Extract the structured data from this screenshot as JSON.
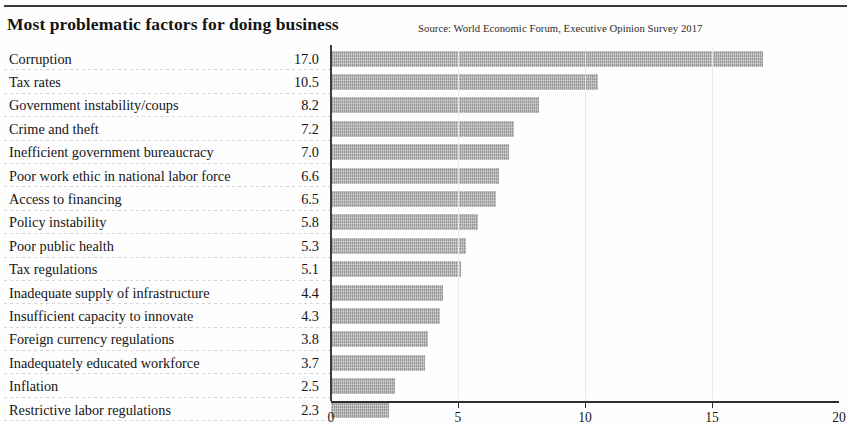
{
  "header": {
    "title": "Most problematic factors for doing business",
    "source": "Source: World Economic Forum, Executive Opinion Survey 2017"
  },
  "axis": {
    "ticks": [
      "0",
      "5",
      "10",
      "15",
      "20"
    ]
  },
  "colors": {
    "bar": "#aaaaaa",
    "axis": "#2f2f2f",
    "text": "#151515",
    "gridline": "#e9e9e9",
    "separator": "#cfcfcf"
  },
  "chart_data": {
    "type": "bar",
    "orientation": "horizontal",
    "title": "Most problematic factors for doing business",
    "subtitle": "Source: World Economic Forum, Executive Opinion Survey 2017",
    "xlabel": "",
    "ylabel": "",
    "xlim": [
      0,
      20
    ],
    "xticks": [
      0,
      5,
      10,
      15,
      20
    ],
    "grid": true,
    "legend": false,
    "value_labels": true,
    "categories": [
      "Corruption",
      "Tax rates",
      "Government instability/coups",
      "Crime and theft",
      "Inefficient government bureaucracy",
      "Poor work ethic in national labor force",
      "Access to financing",
      "Policy instability",
      "Poor public health",
      "Tax regulations",
      "Inadequate supply of infrastructure",
      "Insufficient capacity to innovate",
      "Foreign currency regulations",
      "Inadequately educated workforce",
      "Inflation",
      "Restrictive labor regulations"
    ],
    "values": [
      17.0,
      10.5,
      8.2,
      7.2,
      7.0,
      6.6,
      6.5,
      5.8,
      5.3,
      5.1,
      4.4,
      4.3,
      3.8,
      3.7,
      2.5,
      2.3
    ],
    "value_text": [
      "17.0",
      "10.5",
      "8.2",
      "7.2",
      "7.0",
      "6.6",
      "6.5",
      "5.8",
      "5.3",
      "5.1",
      "4.4",
      "4.3",
      "3.8",
      "3.7",
      "2.5",
      "2.3"
    ]
  }
}
